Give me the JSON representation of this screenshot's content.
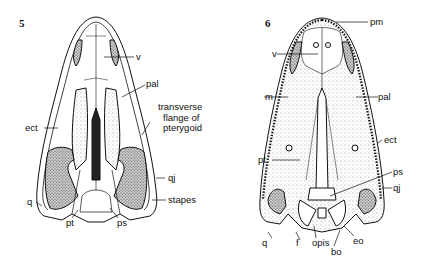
{
  "figures": [
    {
      "number": "5",
      "view": "palatal view of skull",
      "labels": {
        "v": "v",
        "pal": "pal",
        "transverse_flange": [
          "transverse",
          "flange of",
          "pterygoid"
        ],
        "ect": "ect",
        "qj": "qj",
        "q": "q",
        "pt": "pt",
        "ps": "ps",
        "stapes": "stapes"
      }
    },
    {
      "number": "6",
      "view": "palatal view of skull",
      "labels": {
        "pm": "pm",
        "v": "v",
        "m": "m",
        "pal": "pal",
        "ect": "ect",
        "pt": "pt",
        "ps": "ps",
        "qj": "qj",
        "q": "q",
        "f": "f",
        "opis": "opis",
        "bo": "bo",
        "eo": "eo"
      }
    }
  ],
  "colors": {
    "ink": "#111111",
    "background": "#ffffff",
    "shade": "#9a9a9a"
  }
}
